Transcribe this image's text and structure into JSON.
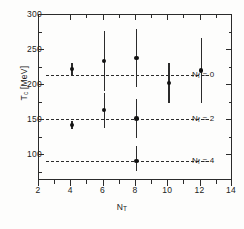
{
  "chart_data": {
    "type": "scatter",
    "title": "",
    "xlabel": "N_T",
    "ylabel": "T_c [MeV]",
    "xlim": [
      2,
      14
    ],
    "ylim": [
      62,
      300
    ],
    "grid": false,
    "legend_position": "right-inline",
    "xticks": [
      2,
      4,
      6,
      8,
      10,
      12,
      14
    ],
    "xtick_labels": [
      "2",
      "4",
      "6",
      "8",
      "10",
      "12",
      "14"
    ],
    "yticks": [
      100,
      150,
      200,
      250,
      300
    ],
    "ytick_labels": [
      "100",
      "150",
      "200",
      "250",
      "300"
    ],
    "reference_lines": [
      {
        "name": "Nf0",
        "value": 213,
        "label": "N",
        "sub": "f",
        "eq": "= 0",
        "style": "dashed"
      },
      {
        "name": "Nf2",
        "value": 150,
        "label": "N",
        "sub": "f",
        "eq": "= 2",
        "style": "dashed"
      },
      {
        "name": "Nf4",
        "value": 90,
        "label": "N",
        "sub": "f",
        "eq": "= 4",
        "style": "dashed"
      }
    ],
    "series": [
      {
        "name": "Nf = 0",
        "marker": "filled-circle",
        "points": [
          {
            "x": 4.1,
            "y": 221,
            "yerr_low": 9,
            "yerr_high": 9
          },
          {
            "x": 6.1,
            "y": 233,
            "yerr_low": 43,
            "yerr_high": 43
          },
          {
            "x": 8.1,
            "y": 237,
            "yerr_low": 41,
            "yerr_high": 41
          },
          {
            "x": 10.1,
            "y": 201,
            "yerr_low": 29,
            "yerr_high": 29
          },
          {
            "x": 12.1,
            "y": 219,
            "yerr_low": 47,
            "yerr_high": 47
          }
        ]
      },
      {
        "name": "Nf = 2",
        "marker": "filled-circle",
        "points": [
          {
            "x": 4.1,
            "y": 141,
            "yerr_low": 6,
            "yerr_high": 6
          },
          {
            "x": 6.1,
            "y": 162,
            "yerr_low": 25,
            "yerr_high": 25
          },
          {
            "x": 8.1,
            "y": 150,
            "yerr_low": 28,
            "yerr_high": 28
          }
        ]
      },
      {
        "name": "Nf = 4",
        "marker": "filled-circle",
        "points": [
          {
            "x": 8.1,
            "y": 89,
            "yerr_low": 14,
            "yerr_high": 22
          }
        ]
      }
    ]
  },
  "axes": {
    "y_title_main": "T",
    "y_title_sub": "c",
    "y_title_unit": " [MeV]",
    "x_title_main": "N",
    "x_title_sub": "T"
  },
  "ytick_labels": {
    "t300": "300",
    "t250": "250",
    "t200": "200",
    "t150": "150",
    "t100": "100"
  },
  "xtick_labels": {
    "t2": "2",
    "t4": "4",
    "t6": "6",
    "t8": "8",
    "t10": "10",
    "t12": "12",
    "t14": "14"
  },
  "legend": {
    "nf0_sym": "N",
    "nf0_sub": "f",
    "nf0_eq": "= 0",
    "nf2_sym": "N",
    "nf2_sub": "f",
    "nf2_eq": "= 2",
    "nf4_sym": "N",
    "nf4_sub": "f",
    "nf4_eq": "= 4"
  },
  "colors": {
    "axis": "#2b2b2b",
    "marker": "#111111",
    "background": "#fdfdfc"
  }
}
